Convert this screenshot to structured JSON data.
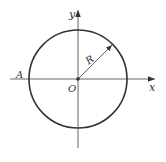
{
  "diagram": {
    "title": "",
    "labels": {
      "y_axis": "y",
      "x_axis": "x",
      "origin": "O",
      "point_a": "A",
      "radius": "R"
    },
    "geometry": {
      "center": [
        78,
        79
      ],
      "radius_px": 49
    },
    "colors": {
      "stroke": "#333333",
      "axis": "#555555"
    }
  }
}
